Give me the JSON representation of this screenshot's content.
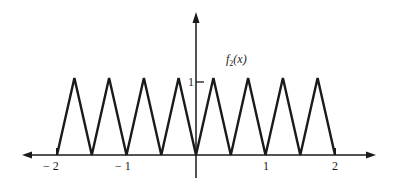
{
  "chart_data": {
    "type": "line",
    "title": "",
    "function_label": "f2(x)",
    "function_label_parts": {
      "name": "f",
      "subscript": "2",
      "arg": "(x)"
    },
    "xlabel": "",
    "ylabel": "",
    "x_ticks": [
      "-2",
      "-1",
      "1",
      "2"
    ],
    "y_ticks": [
      "1"
    ],
    "xlim": [
      -2.2,
      2.5
    ],
    "ylim": [
      0,
      1.6
    ],
    "grid": false,
    "legend": "none",
    "series": [
      {
        "name": "f2(x)",
        "x": [
          -2,
          -1.75,
          -1.5,
          -1.25,
          -1,
          -0.75,
          -0.5,
          -0.25,
          0,
          0.25,
          0.5,
          0.75,
          1,
          1.25,
          1.5,
          1.75,
          2
        ],
        "y": [
          0,
          1,
          0,
          1,
          0,
          1,
          0,
          1,
          0,
          1,
          0,
          1,
          0,
          1,
          0,
          1,
          0
        ]
      }
    ],
    "colors": {
      "ink": "#1a1a1a",
      "background": "#ffffff"
    }
  },
  "labels": {
    "x_neg2": "− 2",
    "x_neg1": "− 1",
    "x_1": "1",
    "x_2": "2",
    "y_1": "1",
    "fn_name": "f",
    "fn_sub": "2",
    "fn_arg": "(x)"
  }
}
